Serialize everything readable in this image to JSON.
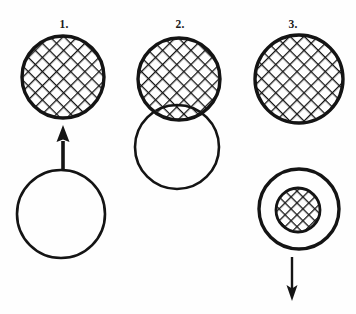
{
  "figure": {
    "background_color": "#fefefe",
    "ink_color": "#141414",
    "width": 356,
    "height": 314,
    "panels": [
      {
        "id": "panel-1",
        "label": "1.",
        "label_x": 64,
        "label_y": 28,
        "description": "A cross-hatched circle above, a plain open circle below, connected by an upward arrow pointing from the plain circle to the hatched circle.",
        "shapes": [
          {
            "name": "hatched-circle-top",
            "kind": "circle",
            "fill": "cross-hatch",
            "cx": 63,
            "cy": 77,
            "r": 41,
            "stroke_width": 3.4
          },
          {
            "name": "plain-circle-bottom",
            "kind": "circle",
            "fill": "none",
            "cx": 61,
            "cy": 214,
            "r": 44,
            "stroke_width": 2.6
          }
        ],
        "arrow": {
          "name": "up-arrow",
          "direction": "up",
          "head": "solid-triangle",
          "x": 63,
          "y_tail": 169,
          "y_tip": 125,
          "shaft_width": 3.6,
          "head_width": 13,
          "head_length": 15
        }
      },
      {
        "id": "panel-2",
        "label": "2.",
        "label_x": 180,
        "label_y": 28,
        "description": "A cross-hatched circle overlapping a plain open circle below it; the plain circle's upper arc is visible through the hatched circle's lower region.",
        "shapes": [
          {
            "name": "plain-circle-bottom",
            "kind": "circle",
            "fill": "none",
            "cx": 177,
            "cy": 147,
            "r": 42,
            "stroke_width": 2.6
          },
          {
            "name": "hatched-circle-top",
            "kind": "circle",
            "fill": "cross-hatch",
            "cx": 179,
            "cy": 79,
            "r": 41,
            "stroke_width": 3.4
          }
        ],
        "arrow": null
      },
      {
        "id": "panel-3",
        "label": "3.",
        "label_x": 293,
        "label_y": 28,
        "description": "A cross-hatched circle above; below it a large plain circle containing a small concentric cross-hatched circle, with a downward arrow beneath.",
        "shapes": [
          {
            "name": "hatched-circle-top",
            "kind": "circle",
            "fill": "cross-hatch",
            "cx": 299,
            "cy": 79,
            "r": 44,
            "stroke_width": 3.4
          },
          {
            "name": "outer-plain-circle",
            "kind": "circle",
            "fill": "none",
            "cx": 299,
            "cy": 209,
            "r": 40,
            "stroke_width": 3.4
          },
          {
            "name": "inner-hatched-circle",
            "kind": "circle",
            "fill": "cross-hatch",
            "cx": 298,
            "cy": 210,
            "r": 22,
            "stroke_width": 2.8
          }
        ],
        "arrow": {
          "name": "down-arrow",
          "direction": "down",
          "head": "open-v-triangle",
          "x": 292,
          "y_tail": 257,
          "y_tip": 301,
          "shaft_width": 2.4,
          "head_width": 11,
          "head_length": 16
        }
      }
    ],
    "hatch": {
      "style": "diagonal cross-hatch",
      "angle_degrees": 45,
      "spacing_px": 10,
      "line_width_px": 2.6,
      "line_color": "#141414"
    }
  }
}
